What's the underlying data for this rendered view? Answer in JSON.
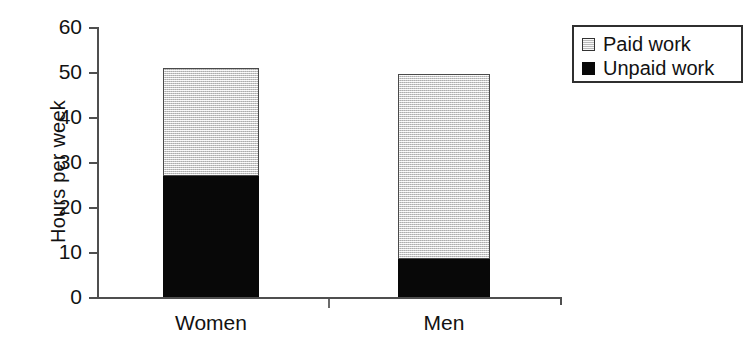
{
  "chart_data": {
    "type": "bar",
    "subtype": "stacked-vertical-bar",
    "title": "",
    "xlabel": "",
    "ylabel": "Hours per week",
    "categories": [
      "Women",
      "Men"
    ],
    "series": [
      {
        "name": "Unpaid work",
        "values": [
          27,
          8.7
        ],
        "color": "#080808"
      },
      {
        "name": "Paid work",
        "values": [
          24,
          40.8
        ],
        "color": "#dcdcdc"
      }
    ],
    "stack_totals": [
      51,
      49.5
    ],
    "ylim": [
      0,
      60
    ],
    "ytick_values": [
      60,
      50,
      40,
      30,
      20,
      10,
      0
    ],
    "ytick_labels": [
      "60",
      "50",
      "40",
      "30",
      "20",
      "10",
      "0"
    ],
    "grid": false,
    "legend_position": "top-right",
    "legend_entries": [
      "Paid work",
      "Unpaid work"
    ]
  },
  "axes": {
    "y_title": "Hours per week",
    "y_ticks": [
      {
        "label": "60",
        "value": 60
      },
      {
        "label": "50",
        "value": 50
      },
      {
        "label": "40",
        "value": 40
      },
      {
        "label": "30",
        "value": 30
      },
      {
        "label": "20",
        "value": 20
      },
      {
        "label": "10",
        "value": 10
      },
      {
        "label": "0",
        "value": 0
      }
    ],
    "x_categories": [
      {
        "label": "Women"
      },
      {
        "label": "Men"
      }
    ]
  },
  "legend": {
    "items": [
      {
        "label": "Paid work",
        "swatch": "paid-swatch-icon",
        "color": "#dcdcdc"
      },
      {
        "label": "Unpaid work",
        "swatch": "unpaid-swatch-icon",
        "color": "#080808"
      }
    ]
  },
  "colors": {
    "paid": "#dcdcdc",
    "unpaid": "#080808",
    "axis": "#4f4f4f",
    "text": "#121212",
    "background": "#ffffff"
  }
}
